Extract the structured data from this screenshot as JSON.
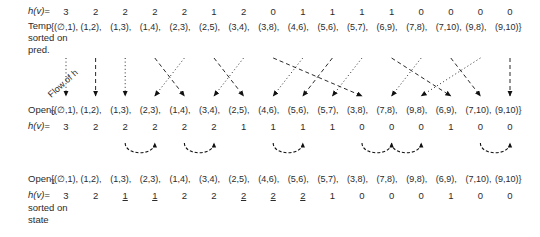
{
  "diagram": {
    "flow_label": "Flow of h",
    "rows": {
      "temp": {
        "label_line1": "Temp",
        "label_line2": "sorted on",
        "label_line3": "pred.",
        "h_label": "h(v)=",
        "h_values": [
          3,
          2,
          2,
          2,
          2,
          1,
          2,
          0,
          1,
          1,
          1,
          1,
          0,
          0,
          0,
          0
        ],
        "open_prefix": "{(",
        "pairs": [
          "∅,1",
          "1,2",
          "1,3",
          "1,4",
          "2,3",
          "2,5",
          "3,4",
          "3,8",
          "4,6",
          "5,6",
          "5,7",
          "6,9",
          "7,8",
          "7,10",
          "9,8",
          "9,10"
        ],
        "open_suffix": ")}"
      },
      "open0": {
        "label": "Open",
        "label_sub": "0",
        "h_label": "h(v)=",
        "h_values": [
          3,
          2,
          2,
          2,
          2,
          2,
          1,
          1,
          1,
          1,
          0,
          0,
          0,
          1,
          0,
          0
        ],
        "pairs": [
          "∅,1",
          "1,2",
          "1,3",
          "2,3",
          "1,4",
          "3,4",
          "2,5",
          "4,6",
          "5,6",
          "5,7",
          "3,8",
          "7,8",
          "9,8",
          "6,9",
          "7,10",
          "9,10"
        ]
      },
      "open1": {
        "label": "Open",
        "label_sub": "1",
        "h_label": "h(v)=",
        "label_line2": "sorted on",
        "label_line3": "state",
        "h_values": [
          3,
          2,
          1,
          1,
          2,
          2,
          2,
          2,
          2,
          1,
          0,
          0,
          0,
          1,
          0,
          0
        ],
        "h_underlined": [
          false,
          false,
          true,
          true,
          false,
          false,
          true,
          true,
          true,
          false,
          false,
          false,
          false,
          false,
          false,
          false
        ],
        "pairs": [
          "∅,1",
          "1,2",
          "1,3",
          "2,3",
          "1,4",
          "3,4",
          "2,5",
          "4,6",
          "5,6",
          "5,7",
          "3,8",
          "7,8",
          "9,8",
          "6,9",
          "7,10",
          "9,10"
        ]
      }
    },
    "colors": {
      "text": "#2b2b2b",
      "arrow": "#1a1a1a"
    }
  }
}
